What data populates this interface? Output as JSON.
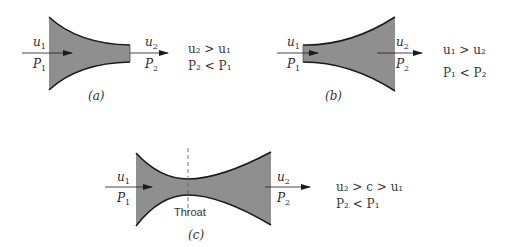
{
  "figure": {
    "panels": [
      {
        "id": "a",
        "caption": "(a)",
        "type": "converging nozzle",
        "inlet": {
          "velocity": "u",
          "velocity_sub": "1",
          "pressure": "P",
          "pressure_sub": "1"
        },
        "outlet": {
          "velocity": "u",
          "velocity_sub": "2",
          "pressure": "P",
          "pressure_sub": "2"
        },
        "relations": [
          "u₂ > u₁",
          "P₂ < P₁"
        ]
      },
      {
        "id": "b",
        "caption": "(b)",
        "type": "diverging nozzle",
        "inlet": {
          "velocity": "u",
          "velocity_sub": "1",
          "pressure": "P",
          "pressure_sub": "1"
        },
        "outlet": {
          "velocity": "u",
          "velocity_sub": "2",
          "pressure": "P",
          "pressure_sub": "2"
        },
        "relations": [
          "u₁ > u₂",
          "P₁ < P₂"
        ]
      },
      {
        "id": "c",
        "caption": "(c)",
        "type": "converging-diverging nozzle",
        "throat_label": "Throat",
        "inlet": {
          "velocity": "u",
          "velocity_sub": "1",
          "pressure": "P",
          "pressure_sub": "1"
        },
        "outlet": {
          "velocity": "u",
          "velocity_sub": "2",
          "pressure": "P",
          "pressure_sub": "2"
        },
        "relations": [
          "u₂ > c > u₁",
          "P₂ < P₁"
        ]
      }
    ],
    "colors": {
      "fill": "#8f8f8f",
      "outline": "#1a1a1a",
      "arrow": "#1a1a1a",
      "text": "#2a2a2a"
    }
  }
}
